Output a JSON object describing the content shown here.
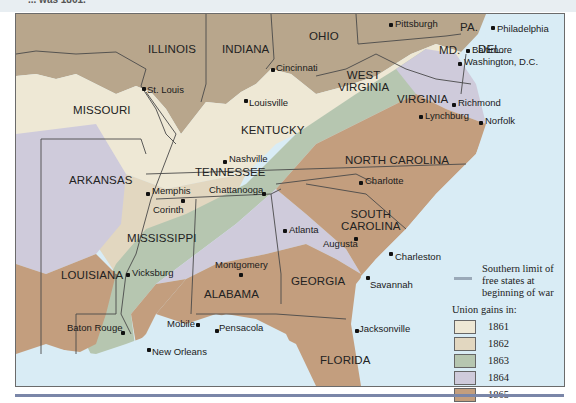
{
  "header": {
    "cropped_caption": "... was 1861."
  },
  "colors": {
    "water": "#d9ecf5",
    "free_states": "#b8a68c",
    "y1861": "#eee8d5",
    "y1862": "#e2d7c0",
    "y1863": "#b6c6b0",
    "y1864": "#cfcbdb",
    "y1865": "#c39e7e",
    "border": "#4a4a4a",
    "limit_line": "#9aa9b8",
    "rule": "#7a86a8"
  },
  "states": [
    {
      "name": "ILLINOIS",
      "x": 132,
      "y": 29
    },
    {
      "name": "INDIANA",
      "x": 206,
      "y": 29
    },
    {
      "name": "OHIO",
      "x": 293,
      "y": 16
    },
    {
      "name": "PA.",
      "x": 444,
      "y": 7
    },
    {
      "name": "DEL.",
      "x": 462,
      "y": 29
    },
    {
      "name": "MD.",
      "x": 423,
      "y": 30
    },
    {
      "name": "WEST\nVIRGINIA",
      "x": 322,
      "y": 55
    },
    {
      "name": "VIRGINIA",
      "x": 381,
      "y": 79
    },
    {
      "name": "MISSOURI",
      "x": 57,
      "y": 90
    },
    {
      "name": "KENTUCKY",
      "x": 225,
      "y": 110
    },
    {
      "name": "TENNESSEE",
      "x": 179,
      "y": 152
    },
    {
      "name": "NORTH CAROLINA",
      "x": 329,
      "y": 140
    },
    {
      "name": "ARKANSAS",
      "x": 53,
      "y": 160
    },
    {
      "name": "SOUTH\nCAROLINA",
      "x": 325,
      "y": 194
    },
    {
      "name": "MISSISSIPPI",
      "x": 111,
      "y": 218
    },
    {
      "name": "LOUISIANA",
      "x": 45,
      "y": 255
    },
    {
      "name": "GEORGIA",
      "x": 275,
      "y": 261
    },
    {
      "name": "ALABAMA",
      "x": 188,
      "y": 274
    },
    {
      "name": "FLORIDA",
      "x": 304,
      "y": 340
    }
  ],
  "cities": [
    {
      "name": "Pittsburgh",
      "dx": 373,
      "dy": 9,
      "lx": 379,
      "ly": 5
    },
    {
      "name": "Philadelphia",
      "dx": 475,
      "dy": 12,
      "lx": 481,
      "ly": 10
    },
    {
      "name": "Baltimore",
      "dx": 450,
      "dy": 35,
      "lx": 456,
      "ly": 31
    },
    {
      "name": "Washington, D.C.",
      "dx": 442,
      "dy": 48,
      "lx": 448,
      "ly": 43
    },
    {
      "name": "Cincinnati",
      "dx": 255,
      "dy": 54,
      "lx": 260,
      "ly": 49
    },
    {
      "name": "St. Louis",
      "dx": 126,
      "dy": 73,
      "lx": 131,
      "ly": 71
    },
    {
      "name": "Louisville",
      "dx": 228,
      "dy": 85,
      "lx": 233,
      "ly": 84
    },
    {
      "name": "Richmond",
      "dx": 436,
      "dy": 89,
      "lx": 442,
      "ly": 84
    },
    {
      "name": "Lynchburg",
      "dx": 403,
      "dy": 101,
      "lx": 409,
      "ly": 97
    },
    {
      "name": "Norfolk",
      "dx": 463,
      "dy": 107,
      "lx": 469,
      "ly": 102
    },
    {
      "name": "Nashville",
      "dx": 207,
      "dy": 146,
      "lx": 213,
      "ly": 140
    },
    {
      "name": "Memphis",
      "dx": 130,
      "dy": 178,
      "lx": 136,
      "ly": 172
    },
    {
      "name": "Chattanooga",
      "dx": 246,
      "dy": 178,
      "lx": 193,
      "ly": 171
    },
    {
      "name": "Charlotte",
      "dx": 343,
      "dy": 167,
      "lx": 349,
      "ly": 162
    },
    {
      "name": "Corinth",
      "dx": 165,
      "dy": 185,
      "lx": 137,
      "ly": 191
    },
    {
      "name": "Atlanta",
      "dx": 267,
      "dy": 215,
      "lx": 273,
      "ly": 211
    },
    {
      "name": "Augusta",
      "dx": 338,
      "dy": 223,
      "lx": 307,
      "ly": 225
    },
    {
      "name": "Charleston",
      "dx": 373,
      "dy": 238,
      "lx": 379,
      "ly": 238
    },
    {
      "name": "Vicksburg",
      "dx": 110,
      "dy": 259,
      "lx": 116,
      "ly": 254
    },
    {
      "name": "Montgomery",
      "dx": 223,
      "dy": 259,
      "lx": 199,
      "ly": 246
    },
    {
      "name": "Savannah",
      "dx": 350,
      "dy": 262,
      "lx": 354,
      "ly": 266
    },
    {
      "name": "Baton Rouge",
      "dx": 105,
      "dy": 317,
      "lx": 51,
      "ly": 309
    },
    {
      "name": "Mobile",
      "dx": 180,
      "dy": 309,
      "lx": 151,
      "ly": 305
    },
    {
      "name": "Pensacola",
      "dx": 199,
      "dy": 315,
      "lx": 203,
      "ly": 309
    },
    {
      "name": "Jacksonville",
      "dx": 339,
      "dy": 315,
      "lx": 343,
      "ly": 310
    },
    {
      "name": "New Orleans",
      "dx": 131,
      "dy": 334,
      "lx": 136,
      "ly": 333
    }
  ],
  "legend": {
    "line_label": "Southern limit of free states at beginning of war",
    "line_label_1": "Southern limit of",
    "line_label_2": "free states at",
    "line_label_3": "beginning of war",
    "title": "Union gains in:",
    "items": [
      {
        "year": "1861",
        "color": "#eee8d5"
      },
      {
        "year": "1862",
        "color": "#e2d7c0"
      },
      {
        "year": "1863",
        "color": "#b6c6b0"
      },
      {
        "year": "1864",
        "color": "#cfcbdb"
      },
      {
        "year": "1865",
        "color": "#c39e7e"
      }
    ]
  }
}
